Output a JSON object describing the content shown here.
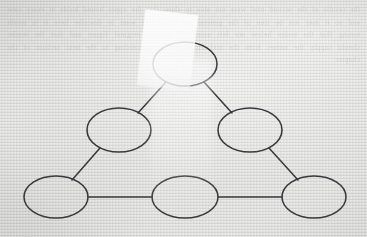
{
  "document": {
    "medium": "scanned paper",
    "background_color": "#dbdbd9",
    "ink_color": "#35353a",
    "bleed_through_text": "the results of the second trial were not able to show that the upper bound holds in every case and so it may not be true of the general set which we want to describe here it is worth noting that the nodes below are left unlabelled in the original figure and that the reader should supply the names from the text above before proceeding to the next section of the chapter",
    "overlay": {
      "name": "paper-slip",
      "color": "#ffffff",
      "opacity": "0.86",
      "rotation_deg": 6.5
    }
  },
  "diagram": {
    "title": "",
    "type": "node-link graph",
    "node_count": 6,
    "edge_count": 6,
    "node_label_style": "unlabelled",
    "nodes": [
      {
        "id": "n-top",
        "label": "",
        "cx": 185,
        "cy": 64,
        "rx": 32,
        "ry": 22
      },
      {
        "id": "n-mid-left",
        "label": "",
        "cx": 119,
        "cy": 130,
        "rx": 32,
        "ry": 22
      },
      {
        "id": "n-mid-right",
        "label": "",
        "cx": 250,
        "cy": 130,
        "rx": 32,
        "ry": 22
      },
      {
        "id": "n-bottom-left",
        "label": "",
        "cx": 56,
        "cy": 197,
        "rx": 32,
        "ry": 21
      },
      {
        "id": "n-bottom-mid",
        "label": "",
        "cx": 185,
        "cy": 197,
        "rx": 33,
        "ry": 21
      },
      {
        "id": "n-bottom-right",
        "label": "",
        "cx": 314,
        "cy": 197,
        "rx": 32,
        "ry": 21
      }
    ],
    "edges": [
      {
        "id": "e-top-midleft",
        "from": "n-top",
        "to": "n-mid-left",
        "x1": 166,
        "y1": 82,
        "x2": 138,
        "y2": 113
      },
      {
        "id": "e-top-midright",
        "from": "n-top",
        "to": "n-mid-right",
        "x1": 204,
        "y1": 82,
        "x2": 232,
        "y2": 113
      },
      {
        "id": "e-midleft-botleft",
        "from": "n-mid-left",
        "to": "n-bottom-left",
        "x1": 100,
        "y1": 148,
        "x2": 72,
        "y2": 180
      },
      {
        "id": "e-midright-botright",
        "from": "n-mid-right",
        "to": "n-bottom-right",
        "x1": 269,
        "y1": 148,
        "x2": 298,
        "y2": 180
      },
      {
        "id": "e-botleft-botmid",
        "from": "n-bottom-left",
        "to": "n-bottom-mid",
        "x1": 88,
        "y1": 197,
        "x2": 152,
        "y2": 197
      },
      {
        "id": "e-botmid-botright",
        "from": "n-bottom-mid",
        "to": "n-bottom-right",
        "x1": 218,
        "y1": 197,
        "x2": 282,
        "y2": 197
      }
    ]
  }
}
